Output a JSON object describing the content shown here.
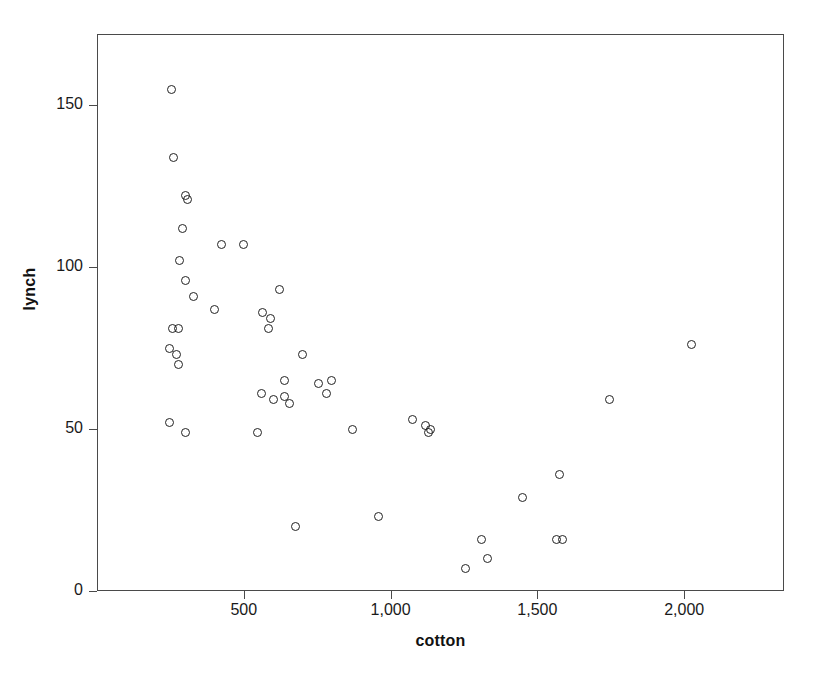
{
  "chart_data": {
    "type": "scatter",
    "title": "",
    "xlabel": "cotton",
    "ylabel": "lynch",
    "xlim": [
      0,
      2340
    ],
    "ylim": [
      0,
      172
    ],
    "grid": false,
    "legend": null,
    "marker": "open-circle",
    "marker_color": "#222222",
    "xticks": [
      500,
      1000,
      1500,
      2000
    ],
    "xticklabels": [
      "500",
      "1,000",
      "1,500",
      "2,000"
    ],
    "yticks": [
      0,
      50,
      100,
      150
    ],
    "yticklabels": [
      "0",
      "50",
      "100",
      "150"
    ],
    "n_points": 55,
    "points": [
      {
        "x": 253,
        "y": 155
      },
      {
        "x": 262,
        "y": 134
      },
      {
        "x": 300,
        "y": 122
      },
      {
        "x": 308,
        "y": 121
      },
      {
        "x": 290,
        "y": 112
      },
      {
        "x": 282,
        "y": 102
      },
      {
        "x": 425,
        "y": 107
      },
      {
        "x": 500,
        "y": 107
      },
      {
        "x": 300,
        "y": 96
      },
      {
        "x": 330,
        "y": 91
      },
      {
        "x": 620,
        "y": 93
      },
      {
        "x": 400,
        "y": 87
      },
      {
        "x": 565,
        "y": 86
      },
      {
        "x": 590,
        "y": 84
      },
      {
        "x": 585,
        "y": 81
      },
      {
        "x": 258,
        "y": 81
      },
      {
        "x": 276,
        "y": 81
      },
      {
        "x": 247,
        "y": 75
      },
      {
        "x": 272,
        "y": 73
      },
      {
        "x": 276,
        "y": 70
      },
      {
        "x": 700,
        "y": 73
      },
      {
        "x": 2025,
        "y": 76
      },
      {
        "x": 640,
        "y": 65
      },
      {
        "x": 800,
        "y": 65
      },
      {
        "x": 755,
        "y": 64
      },
      {
        "x": 560,
        "y": 61
      },
      {
        "x": 640,
        "y": 60
      },
      {
        "x": 780,
        "y": 61
      },
      {
        "x": 600,
        "y": 59
      },
      {
        "x": 655,
        "y": 58
      },
      {
        "x": 1745,
        "y": 59
      },
      {
        "x": 248,
        "y": 52
      },
      {
        "x": 1075,
        "y": 53
      },
      {
        "x": 1120,
        "y": 51
      },
      {
        "x": 1135,
        "y": 50
      },
      {
        "x": 1128,
        "y": 49
      },
      {
        "x": 300,
        "y": 49
      },
      {
        "x": 548,
        "y": 49
      },
      {
        "x": 870,
        "y": 50
      },
      {
        "x": 1575,
        "y": 36
      },
      {
        "x": 1450,
        "y": 29
      },
      {
        "x": 960,
        "y": 23
      },
      {
        "x": 675,
        "y": 20
      },
      {
        "x": 1310,
        "y": 16
      },
      {
        "x": 1565,
        "y": 16
      },
      {
        "x": 1585,
        "y": 16
      },
      {
        "x": 1330,
        "y": 10
      },
      {
        "x": 1255,
        "y": 7
      }
    ]
  },
  "axes": {
    "x_tick_labels": [
      "500",
      "1,000",
      "1,500",
      "2,000"
    ],
    "y_tick_labels": [
      "0",
      "50",
      "100",
      "150"
    ],
    "x_title": "cotton",
    "y_title": "lynch"
  }
}
